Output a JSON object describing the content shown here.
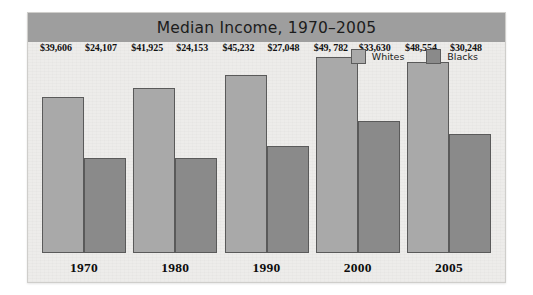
{
  "chart": {
    "title": "Median Income, 1970–2005",
    "legend": [
      {
        "label": "Whites",
        "color": "#a9a9a9",
        "swatch_icon": "legend-swatch-whites"
      },
      {
        "label": "Blacks",
        "color": "#8a8a8a",
        "swatch_icon": "legend-swatch-blacks"
      }
    ]
  },
  "chart_data": {
    "type": "bar",
    "title": "Median Income, 1970–2005",
    "xlabel": "",
    "ylabel": "",
    "grid": false,
    "legend_position": "top-right",
    "ylim": [
      0,
      50000
    ],
    "categories": [
      "1970",
      "1980",
      "1990",
      "2000",
      "2005"
    ],
    "series": [
      {
        "name": "Whites",
        "color": "#a9a9a9",
        "values": [
          39606,
          41925,
          45232,
          49782,
          48554
        ],
        "labels": [
          "$39,606",
          "$41,925",
          "$45,232",
          "$49, 782",
          "$48,554"
        ]
      },
      {
        "name": "Blacks",
        "color": "#8a8a8a",
        "values": [
          24107,
          24153,
          27048,
          33630,
          30248
        ],
        "labels": [
          "$24,107",
          "$24,153",
          "$27,048",
          "$33,630",
          "$30,248"
        ]
      }
    ]
  }
}
